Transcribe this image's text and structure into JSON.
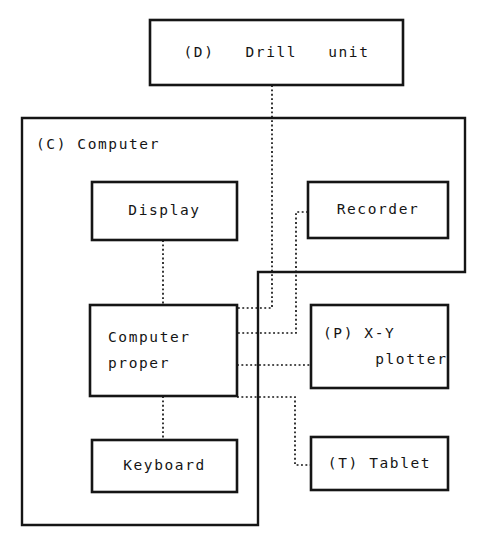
{
  "diagram": {
    "stroke_color": "#151515",
    "background_color": "#ffffff",
    "connector_style": "dotted",
    "boxes": {
      "drill_unit": {
        "label": "(D)   Drill   unit"
      },
      "computer_group": {
        "label": "(C) Computer"
      },
      "display": {
        "label": "Display"
      },
      "recorder": {
        "label": "Recorder"
      },
      "computer_proper": {
        "line1": "Computer",
        "line2": "proper"
      },
      "xy_plotter": {
        "line1": "(P) X-Y",
        "line2": "plotter"
      },
      "keyboard": {
        "label": "Keyboard"
      },
      "tablet": {
        "label": "(T) Tablet"
      }
    }
  }
}
